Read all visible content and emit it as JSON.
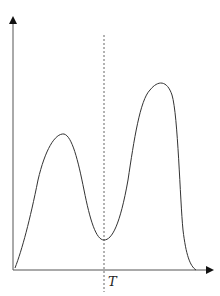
{
  "diagram": {
    "type": "bimodal-curve",
    "axes": {
      "x_arrow": true,
      "y_arrow": true,
      "x_label": "",
      "y_label": ""
    },
    "threshold": {
      "label": "T",
      "style": "dashed-vertical"
    },
    "curve": {
      "description": "bimodal distribution with lower left peak, valley at T, higher right peak",
      "left_peak": "lower",
      "right_peak": "higher",
      "valley_at": "T"
    },
    "colors": {
      "stroke": "#333333",
      "background": "#ffffff"
    }
  }
}
